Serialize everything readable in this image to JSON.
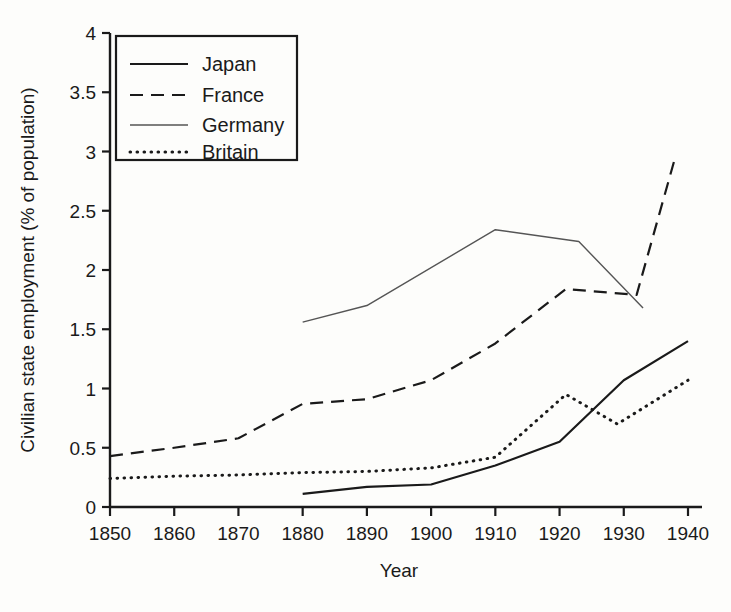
{
  "chart_data": {
    "type": "line",
    "title": "",
    "xlabel": "Year",
    "ylabel": "Civilian state employment (% of population)",
    "xlim": [
      1850,
      1940
    ],
    "ylim": [
      0,
      4
    ],
    "xticks": [
      1850,
      1860,
      1870,
      1880,
      1890,
      1900,
      1910,
      1920,
      1930,
      1940
    ],
    "yticks": [
      "0",
      "0.5",
      "1",
      "1.5",
      "2",
      "2.5",
      "3",
      "3.5",
      "4"
    ],
    "grid": false,
    "legend_position": "top-left",
    "series": [
      {
        "name": "Japan",
        "style": "solid",
        "color": "#1a1a1a",
        "width": 2.2,
        "points": [
          {
            "x": 1880,
            "y": 0.11
          },
          {
            "x": 1890,
            "y": 0.17
          },
          {
            "x": 1900,
            "y": 0.19
          },
          {
            "x": 1910,
            "y": 0.35
          },
          {
            "x": 1920,
            "y": 0.55
          },
          {
            "x": 1930,
            "y": 1.07
          },
          {
            "x": 1940,
            "y": 1.4
          }
        ]
      },
      {
        "name": "France",
        "style": "dashed",
        "color": "#1a1a1a",
        "width": 2.2,
        "points": [
          {
            "x": 1850,
            "y": 0.43
          },
          {
            "x": 1860,
            "y": 0.5
          },
          {
            "x": 1870,
            "y": 0.58
          },
          {
            "x": 1880,
            "y": 0.87
          },
          {
            "x": 1890,
            "y": 0.91
          },
          {
            "x": 1900,
            "y": 1.07
          },
          {
            "x": 1910,
            "y": 1.38
          },
          {
            "x": 1921,
            "y": 1.84
          },
          {
            "x": 1932,
            "y": 1.79
          },
          {
            "x": 1938,
            "y": 2.95
          }
        ]
      },
      {
        "name": "Germany",
        "style": "solid-thin",
        "color": "#555555",
        "width": 1.4,
        "points": [
          {
            "x": 1880,
            "y": 1.56
          },
          {
            "x": 1890,
            "y": 1.7
          },
          {
            "x": 1910,
            "y": 2.34
          },
          {
            "x": 1923,
            "y": 2.24
          },
          {
            "x": 1933,
            "y": 1.68
          }
        ]
      },
      {
        "name": "Britain",
        "style": "dotted",
        "color": "#1a1a1a",
        "width": 3.0,
        "points": [
          {
            "x": 1850,
            "y": 0.24
          },
          {
            "x": 1860,
            "y": 0.26
          },
          {
            "x": 1870,
            "y": 0.27
          },
          {
            "x": 1880,
            "y": 0.29
          },
          {
            "x": 1890,
            "y": 0.3
          },
          {
            "x": 1900,
            "y": 0.33
          },
          {
            "x": 1910,
            "y": 0.42
          },
          {
            "x": 1921,
            "y": 0.95
          },
          {
            "x": 1929,
            "y": 0.7
          },
          {
            "x": 1940,
            "y": 1.07
          }
        ]
      }
    ],
    "legend_entries": [
      {
        "label": "Japan",
        "style": "solid"
      },
      {
        "label": "France",
        "style": "dashed"
      },
      {
        "label": "Germany",
        "style": "solid-thin"
      },
      {
        "label": "Britain",
        "style": "dotted"
      }
    ]
  }
}
